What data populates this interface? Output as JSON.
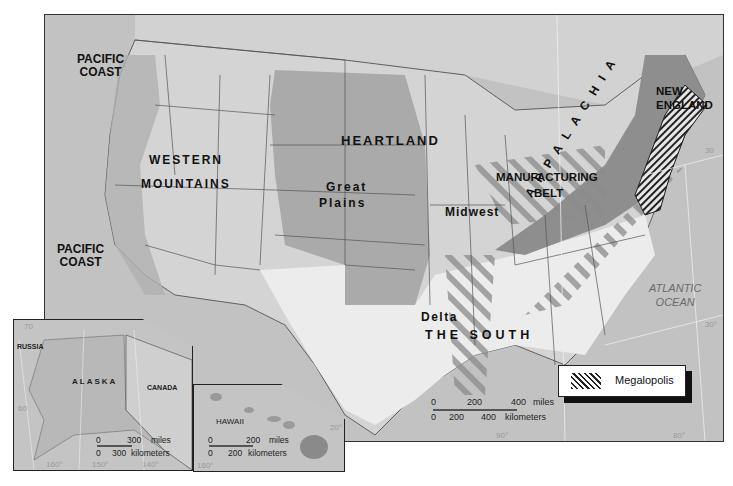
{
  "map": {
    "regions": [
      {
        "id": "pacific-coast-north",
        "label": "PACIFIC\nCOAST"
      },
      {
        "id": "pacific-coast-south",
        "label": "PACIFIC\nCOAST"
      },
      {
        "id": "western-mountains",
        "label_line1": "WESTERN",
        "label_line2": "MOUNTAINS"
      },
      {
        "id": "heartland",
        "label": "HEARTLAND"
      },
      {
        "id": "great-plains",
        "label_line1": "Great",
        "label_line2": "Plains"
      },
      {
        "id": "midwest",
        "label": "Midwest"
      },
      {
        "id": "manufacturing-belt",
        "label_line1": "MANUFACTURING",
        "label_line2": "BELT"
      },
      {
        "id": "new-england",
        "label_line1": "NEW",
        "label_line2": "ENGLAND"
      },
      {
        "id": "appalachia",
        "label": "APPALACHIA"
      },
      {
        "id": "delta",
        "label": "Delta"
      },
      {
        "id": "the-south",
        "label": "THE SOUTH"
      }
    ],
    "ocean": {
      "line1": "ATLANTIC",
      "line2": "OCEAN"
    },
    "degrees": {
      "lat30_east": "30°",
      "lat30_right": "30°",
      "lon90": "90°",
      "lon80": "80°",
      "lat20": "20°",
      "lat30_top": "30"
    },
    "scale": {
      "miles_0": "0",
      "miles_200": "200",
      "miles_400": "400",
      "miles_unit": "miles",
      "km_0": "0",
      "km_200": "200",
      "km_400": "400",
      "km_unit": "kilometers"
    }
  },
  "alaska_inset": {
    "title": "ALASKA",
    "russia": "RUSSIA",
    "canada": "CANADA",
    "scale": {
      "miles_0": "0",
      "miles_300": "300",
      "miles_unit": "miles",
      "km_0": "0",
      "km_300": "300",
      "km_unit": "kilometers"
    },
    "degrees": {
      "lon160": "160°",
      "lon150": "150°",
      "lon140": "140°",
      "lat70": "70",
      "lat60": "60"
    }
  },
  "hawaii_inset": {
    "title": "HAWAII",
    "scale": {
      "miles_0": "0",
      "miles_200": "200",
      "miles_unit": "miles",
      "km_0": "0",
      "km_200": "200",
      "km_unit": "kilometers"
    },
    "degrees": {
      "lon160": "160°",
      "lat20": "20°"
    }
  },
  "legend": {
    "label": "Megalopolis",
    "pattern": "diagonal-hatch"
  },
  "colors": {
    "land": "#cfcfcf",
    "ocean": "#bdbdbd",
    "heartland": "#a8a8a8",
    "appalachia": "#8f8f8f",
    "south": "#e8e8e8",
    "border": "#333333"
  }
}
